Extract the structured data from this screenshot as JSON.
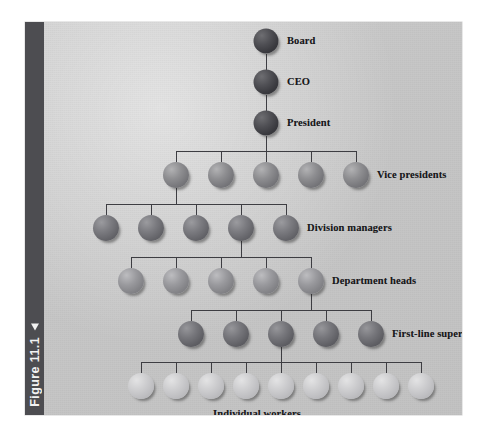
{
  "figure": {
    "caption": "Figure 11.1",
    "marker_icon": "triangle-marker-icon",
    "sidebar_color": "#4d4d51",
    "panel_color": "#c6c6c6"
  },
  "chart_data": {
    "type": "diagram",
    "subtype": "organizational-hierarchy-pyramid",
    "title": "Figure 11.1",
    "orientation": "top-down",
    "node_shape": "sphere",
    "connector_style": "orthogonal-bracket",
    "levels": [
      {
        "id": "board",
        "label": "Board",
        "label_position": "right",
        "count": 1,
        "tone": "tone-exec",
        "color": "#3a3a3f",
        "radius": 12.5,
        "y": 19,
        "x_positions": [
          222
        ]
      },
      {
        "id": "ceo",
        "label": "CEO",
        "label_position": "right",
        "count": 1,
        "tone": "tone-exec",
        "color": "#3a3a3f",
        "radius": 12.5,
        "y": 60,
        "x_positions": [
          222
        ]
      },
      {
        "id": "president",
        "label": "President",
        "label_position": "right",
        "count": 1,
        "tone": "tone-exec",
        "color": "#3a3a3f",
        "radius": 12.5,
        "y": 101,
        "x_positions": [
          222
        ]
      },
      {
        "id": "vice-presidents",
        "label": "Vice presidents",
        "label_position": "right",
        "count": 5,
        "tone": "tone-vp",
        "color": "#76767a",
        "radius": 13,
        "y": 153,
        "x_positions": [
          132,
          177,
          222,
          267,
          312
        ]
      },
      {
        "id": "division-managers",
        "label": "Division managers",
        "label_position": "right",
        "count": 5,
        "tone": "tone-div",
        "color": "#646469",
        "radius": 13,
        "y": 206,
        "x_positions": [
          62,
          107,
          152,
          197,
          242
        ]
      },
      {
        "id": "department-heads",
        "label": "Department heads",
        "label_position": "right",
        "count": 5,
        "tone": "tone-dept",
        "color": "#838387",
        "radius": 13,
        "y": 259,
        "x_positions": [
          87,
          132,
          177,
          222,
          267
        ]
      },
      {
        "id": "first-line-supervisors",
        "label": "First-line supervisors",
        "label_position": "right",
        "count": 5,
        "tone": "tone-sup",
        "color": "#5f5f64",
        "radius": 13,
        "y": 312,
        "x_positions": [
          147,
          192,
          237,
          282,
          327
        ]
      },
      {
        "id": "individual-workers",
        "label": "Individual workers",
        "label_position": "below-center",
        "count": 9,
        "tone": "tone-worker",
        "color": "#bdbdc0",
        "radius": 13,
        "y": 364,
        "x_positions": [
          97,
          132,
          167,
          202,
          237,
          272,
          307,
          342,
          377
        ]
      }
    ],
    "branch_sources": {
      "president_to_vice_presidents": {
        "from_index": 0,
        "note": "single president feeds all 5 VPs"
      },
      "vice_presidents_to_division_managers": {
        "from_index": 0,
        "note": "leftmost VP feeds 5 division managers"
      },
      "division_managers_to_department_heads": {
        "from_index": 3,
        "note": "4th division manager feeds 5 department heads"
      },
      "department_heads_to_supervisors": {
        "from_index": 4,
        "note": "rightmost department head feeds 5 supervisors"
      },
      "supervisors_to_workers": {
        "from_index": 2,
        "note": "center supervisor feeds 9 individual workers"
      }
    },
    "label_coords": [
      {
        "id": "board",
        "x": 243,
        "y": 19
      },
      {
        "id": "ceo",
        "x": 243,
        "y": 60
      },
      {
        "id": "president",
        "x": 243,
        "y": 101
      },
      {
        "id": "vice-presidents",
        "x": 333,
        "y": 153
      },
      {
        "id": "division-managers",
        "x": 263,
        "y": 206
      },
      {
        "id": "department-heads",
        "x": 288,
        "y": 259
      },
      {
        "id": "first-line-supervisors",
        "x": 348,
        "y": 312
      },
      {
        "id": "individual-workers",
        "x": 213,
        "y": 392
      }
    ],
    "connector_color": "#3d3d42",
    "connector_width": 1
  }
}
